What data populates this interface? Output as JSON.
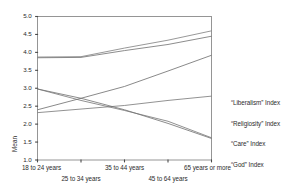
{
  "chart_data": {
    "type": "line",
    "title": "",
    "xlabel": "",
    "ylabel": "Mean",
    "ylim": [
      1.0,
      5.0
    ],
    "ytick_labels": [
      "5.0",
      "4.5",
      "4.0",
      "3.5",
      "3.0",
      "2.5",
      "2.0",
      "1.5",
      "1.0"
    ],
    "ytick_values": [
      5.0,
      4.5,
      4.0,
      3.5,
      3.0,
      2.5,
      2.0,
      1.5,
      1.0
    ],
    "grid": false,
    "legend_position": "right",
    "categories": [
      "18 to 24 years",
      "25 to 34 years",
      "35 to 44 years",
      "45 to 64 years",
      "65 years or more"
    ],
    "series": [
      {
        "name": "“Liberalism” Index",
        "color": "#7d7d7d",
        "values": [
          3.87,
          3.88,
          4.12,
          4.34,
          4.6
        ]
      },
      {
        "name": "“Religiosity” Index",
        "color": "#6e6e6e",
        "values": [
          3.85,
          3.86,
          4.05,
          4.22,
          4.45
        ]
      },
      {
        "name": "“Care” Index",
        "color": "#6b6b6b",
        "values": [
          2.4,
          2.72,
          3.05,
          3.48,
          3.92
        ]
      },
      {
        "name": "“God” Index",
        "color": "#767676",
        "values": [
          2.32,
          2.42,
          2.52,
          2.66,
          2.78
        ]
      },
      {
        "name": "declining-series-a",
        "color": "#6f6f6f",
        "values": [
          2.98,
          2.72,
          2.4,
          2.02,
          1.6
        ]
      },
      {
        "name": "declining-series-b",
        "color": "#757575",
        "values": [
          2.98,
          2.66,
          2.38,
          2.08,
          1.62
        ]
      }
    ],
    "legend_entries": [
      "“Liberalism” Index",
      "“Religiosity” Index",
      "“Care” Index",
      "“God” Index"
    ]
  },
  "axis": {
    "y_title": "Mean"
  }
}
